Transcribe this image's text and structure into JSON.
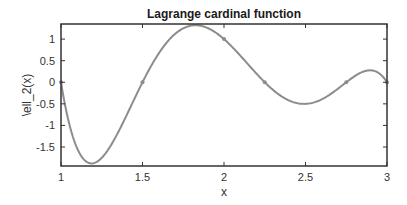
{
  "chart_data": {
    "type": "line",
    "title": "Lagrange cardinal function",
    "xlabel": "x",
    "ylabel": "\\ell_2(x)",
    "xlim": [
      1,
      3
    ],
    "ylim": [
      -1.94,
      1.35
    ],
    "xticks": [
      1,
      1.5,
      2,
      2.5,
      3
    ],
    "xtick_labels": [
      "1",
      "1.5",
      "2",
      "2.5",
      "3"
    ],
    "yticks": [
      -1.5,
      -1,
      -0.5,
      0,
      0.5,
      1
    ],
    "ytick_labels": [
      "-1.5",
      "-1",
      "-0.5",
      "0",
      "0.5",
      "1"
    ],
    "grid": false,
    "legend": null,
    "series": [
      {
        "name": "\\ell_2(x)",
        "style": "line",
        "color": "#8c8c8c",
        "description": "degree-5 Lagrange cardinal polynomial, zero at nodes 1, 1.5, 2.25, 2.75, 3 and one at node 2",
        "nodes": [
          1,
          1.5,
          2,
          2.25,
          2.75,
          3
        ],
        "index": 2,
        "x": [
          1.0,
          1.1,
          1.2,
          1.3,
          1.4,
          1.5,
          1.6,
          1.7,
          1.8,
          1.9,
          2.0,
          2.1,
          2.2,
          2.25,
          2.3,
          2.4,
          2.5,
          2.6,
          2.7,
          2.75,
          2.8,
          2.9,
          3.0
        ],
        "y": [
          0.0,
          -1.58,
          -1.88,
          -1.52,
          -0.82,
          0.0,
          0.74,
          1.21,
          1.31,
          1.17,
          1.0,
          0.56,
          0.17,
          0.0,
          -0.15,
          -0.38,
          -0.5,
          -0.44,
          -0.19,
          0.0,
          0.16,
          0.28,
          0.0
        ]
      },
      {
        "name": "nodes",
        "style": "markers",
        "color": "#8c8c8c",
        "x": [
          1,
          1.5,
          2,
          2.25,
          2.75,
          3
        ],
        "y": [
          0,
          0,
          1,
          0,
          0,
          0
        ]
      }
    ],
    "annotations": [
      {
        "label": "minimum",
        "x": 1.19,
        "y": -1.88
      },
      {
        "label": "maximum",
        "x": 1.82,
        "y": 1.32
      },
      {
        "label": "local minimum",
        "x": 2.49,
        "y": -0.5
      },
      {
        "label": "local maximum",
        "x": 2.9,
        "y": 0.28
      }
    ]
  },
  "colors": {
    "axes": "#333333",
    "line": "#8c8c8c",
    "background": "#ffffff"
  }
}
